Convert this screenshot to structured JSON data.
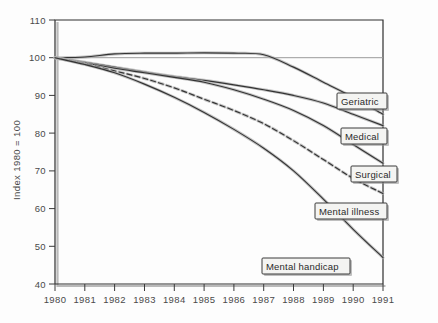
{
  "chart_data": {
    "type": "line",
    "title": "",
    "subtitle": "",
    "xlabel": "",
    "ylabel": "Index 1980 = 100",
    "xlim": [
      1980,
      1991
    ],
    "ylim": [
      40,
      110
    ],
    "ytick_step": 10,
    "grid": false,
    "legend_position": "inline-right-callouts",
    "x": [
      1980,
      1981,
      1982,
      1983,
      1984,
      1985,
      1986,
      1987,
      1988,
      1989,
      1990,
      1991
    ],
    "xtick_labels": [
      "1980",
      "1981",
      "1982",
      "1983",
      "1984",
      "1985",
      "1986",
      "1987",
      "1988",
      "1989",
      "1990",
      "1991"
    ],
    "ytick_labels": [
      "40",
      "50",
      "60",
      "70",
      "80",
      "90",
      "100",
      "110"
    ],
    "ytick_values": [
      40,
      50,
      60,
      70,
      80,
      90,
      100,
      110
    ],
    "reference_line": {
      "value": 100,
      "label": "",
      "visible": true
    },
    "series": [
      {
        "name": "Geriatric",
        "style": "solid",
        "label_anchor_year": 1991,
        "label_anchor_value": 85,
        "values": [
          100,
          100.2,
          101.0,
          101.2,
          101.2,
          101.3,
          101.2,
          100.8,
          97.5,
          93.5,
          89.5,
          85.0
        ]
      },
      {
        "name": "Medical",
        "style": "solid",
        "label_anchor_year": 1991,
        "label_anchor_value": 82,
        "values": [
          100,
          98.8,
          97.5,
          96.2,
          95.0,
          94.0,
          92.8,
          91.5,
          90.0,
          88.0,
          85.0,
          82.0
        ]
      },
      {
        "name": "Surgical",
        "style": "solid",
        "label_anchor_year": 1991,
        "label_anchor_value": 72,
        "values": [
          100,
          98.6,
          97.2,
          96.0,
          94.8,
          93.5,
          91.5,
          89.0,
          86.0,
          82.0,
          77.0,
          72.0
        ]
      },
      {
        "name": "Mental illness",
        "style": "dashed",
        "label_anchor_year": 1991,
        "label_anchor_value": 64,
        "values": [
          100,
          98.4,
          96.5,
          94.5,
          92.0,
          89.0,
          86.0,
          82.5,
          78.0,
          73.0,
          68.0,
          64.0
        ]
      },
      {
        "name": "Mental handicap",
        "style": "solid",
        "label_anchor_year": 1991,
        "label_anchor_value": 47,
        "values": [
          100,
          98.2,
          96.0,
          93.0,
          89.5,
          85.5,
          81.0,
          76.0,
          70.0,
          62.5,
          54.5,
          47.0
        ]
      }
    ],
    "annotations": [
      {
        "name": "Geriatric",
        "text": "Geriatric"
      },
      {
        "name": "Medical",
        "text": "Medical"
      },
      {
        "name": "Surgical",
        "text": "Surgical"
      },
      {
        "name": "Mental illness",
        "text": "Mental illness"
      },
      {
        "name": "Mental handicap",
        "text": "Mental handicap"
      }
    ],
    "colors": {
      "line": "#333333",
      "line_halo": "#b0b0b0",
      "axis": "#2f2f2f",
      "text": "#4a4a4a",
      "label_box_fill": "#f4f4f2",
      "label_box_stroke": "#3b3b3b",
      "background": "#fdfdfd"
    }
  },
  "axis": {
    "y_title": "Index 1980 = 100"
  },
  "labels": {
    "geriatric": "Geriatric",
    "medical": "Medical",
    "surgical": "Surgical",
    "mental_illness": "Mental illness",
    "mental_handicap": "Mental handicap"
  },
  "yticks": {
    "t110": "110",
    "t100": "100",
    "t90": "90",
    "t80": "80",
    "t70": "70",
    "t60": "60",
    "t50": "50",
    "t40": "40"
  },
  "xticks": {
    "x1980": "1980",
    "x1981": "1981",
    "x1982": "1982",
    "x1983": "1983",
    "x1984": "1984",
    "x1985": "1985",
    "x1986": "1986",
    "x1987": "1987",
    "x1988": "1988",
    "x1989": "1989",
    "x1990": "1990",
    "x1991": "1991"
  }
}
